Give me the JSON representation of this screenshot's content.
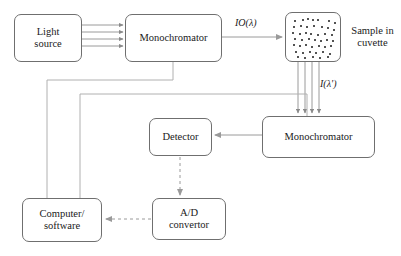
{
  "diagram": {
    "type": "block-flow-diagram",
    "background_color": "#ffffff",
    "stroke_color": "#6f6f6f",
    "beam_color": "#8a8a8a",
    "text_color": "#1a1a1a",
    "nodes": [
      {
        "id": "light-source",
        "label": "Light\nsource",
        "x": 14,
        "y": 14,
        "w": 68,
        "h": 48
      },
      {
        "id": "monochromator-1",
        "label": "Monochromator",
        "x": 125,
        "y": 14,
        "w": 97,
        "h": 48
      },
      {
        "id": "sample-cuvette",
        "label": "",
        "x": 285,
        "y": 12,
        "w": 56,
        "h": 50
      },
      {
        "id": "monochromator-2",
        "label": "Monochromator",
        "x": 262,
        "y": 116,
        "w": 113,
        "h": 42
      },
      {
        "id": "detector",
        "label": "Detector",
        "x": 149,
        "y": 118,
        "w": 63,
        "h": 38
      },
      {
        "id": "ad-convertor",
        "label": "A/D\nconvertor",
        "x": 152,
        "y": 198,
        "w": 74,
        "h": 42
      },
      {
        "id": "computer-software",
        "label": "Computer/\nsoftware",
        "x": 22,
        "y": 198,
        "w": 80,
        "h": 44
      }
    ],
    "free_labels": [
      {
        "id": "sample-in-cuvette",
        "text": "Sample in\ncuvette",
        "x": 345,
        "y": 25,
        "w": 55
      }
    ],
    "flow_labels": [
      {
        "id": "incident-intensity",
        "text": "IO(λ)",
        "x": 235,
        "y": 17
      },
      {
        "id": "transmitted-intensity",
        "text": "I(λ')",
        "x": 320,
        "y": 78
      }
    ],
    "connections": [
      {
        "id": "source-to-mono1",
        "style": "multi-beam",
        "lines": 4,
        "from": "light-source",
        "to": "monochromator-1"
      },
      {
        "id": "mono1-to-cuvette",
        "style": "solid-arrow",
        "from": "monochromator-1",
        "to": "sample-cuvette"
      },
      {
        "id": "cuvette-to-mono2",
        "style": "multi-beam",
        "lines": 4,
        "from": "sample-cuvette",
        "to": "monochromator-2"
      },
      {
        "id": "mono2-to-detector",
        "style": "solid-arrow",
        "from": "monochromator-2",
        "to": "detector"
      },
      {
        "id": "detector-to-ad",
        "style": "dashed-arrow",
        "from": "detector",
        "to": "ad-convertor"
      },
      {
        "id": "ad-to-computer",
        "style": "dashed-arrow",
        "from": "ad-convertor",
        "to": "computer-software"
      },
      {
        "id": "computer-to-mono1",
        "style": "control-line",
        "from": "computer-software",
        "to": "monochromator-1"
      },
      {
        "id": "computer-to-mono2",
        "style": "control-line",
        "from": "computer-software",
        "to": "monochromator-2"
      }
    ],
    "cuvette_dots": [
      [
        8,
        7
      ],
      [
        16,
        6
      ],
      [
        21,
        5
      ],
      [
        26,
        6
      ],
      [
        31,
        6
      ],
      [
        42,
        7
      ],
      [
        48,
        9
      ],
      [
        7,
        13
      ],
      [
        14,
        12
      ],
      [
        20,
        13
      ],
      [
        27,
        12
      ],
      [
        35,
        13
      ],
      [
        41,
        14
      ],
      [
        47,
        16
      ],
      [
        6,
        19
      ],
      [
        13,
        20
      ],
      [
        19,
        19
      ],
      [
        24,
        20
      ],
      [
        31,
        21
      ],
      [
        38,
        20
      ],
      [
        45,
        21
      ],
      [
        8,
        25
      ],
      [
        15,
        26
      ],
      [
        22,
        25
      ],
      [
        28,
        26
      ],
      [
        34,
        27
      ],
      [
        40,
        26
      ],
      [
        46,
        27
      ],
      [
        7,
        31
      ],
      [
        13,
        32
      ],
      [
        19,
        31
      ],
      [
        25,
        33
      ],
      [
        32,
        32
      ],
      [
        38,
        33
      ],
      [
        44,
        32
      ],
      [
        9,
        38
      ],
      [
        16,
        39
      ],
      [
        23,
        38
      ],
      [
        29,
        39
      ],
      [
        36,
        38
      ],
      [
        43,
        40
      ],
      [
        11,
        43
      ],
      [
        18,
        44
      ],
      [
        26,
        43
      ],
      [
        33,
        44
      ],
      [
        41,
        43
      ]
    ]
  }
}
